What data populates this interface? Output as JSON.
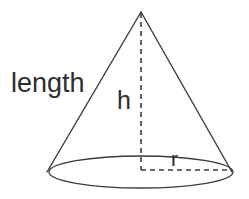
{
  "figure": {
    "name": "cone-geometry-diagram",
    "type": "geometric-diagram",
    "shape": "cone",
    "canvas": {
      "width": 249,
      "height": 199
    },
    "background_color": "#ffffff",
    "stroke_color": "#3a3a3a",
    "text_color": "#2e2e2e",
    "stroke_width": 1.3
  },
  "labels": {
    "slant_height": "length",
    "height": "h",
    "radius": "r"
  },
  "geometry": {
    "apex": {
      "x": 141,
      "y": 12
    },
    "base_center": {
      "x": 141,
      "y": 172
    },
    "base_rx": 92,
    "base_ry": 16,
    "left_base_point": {
      "x": 47,
      "y": 172
    },
    "right_base_point": {
      "x": 232,
      "y": 172
    },
    "height_line": {
      "x": 141,
      "y1": 12,
      "y2": 170,
      "style": "dashed"
    },
    "radius_line": {
      "y": 170,
      "x1": 141,
      "x2": 232,
      "style": "dashed"
    }
  }
}
